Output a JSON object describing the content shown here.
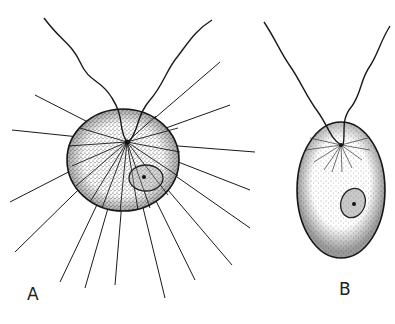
{
  "figure": {
    "panels": [
      {
        "id": "A",
        "label": "A",
        "description": "Spherical flagellate cell with two flagella and radiating axopodia-like spines, stippled cytoplasm, nucleus lower right"
      },
      {
        "id": "B",
        "label": "B",
        "description": "Ovoid flagellate cell with two flagella emerging from apex, fine radiating fibrils, stippled cytoplasm, central nucleus"
      }
    ],
    "colors": {
      "ink": "#1a1a1a",
      "background": "#ffffff"
    }
  }
}
